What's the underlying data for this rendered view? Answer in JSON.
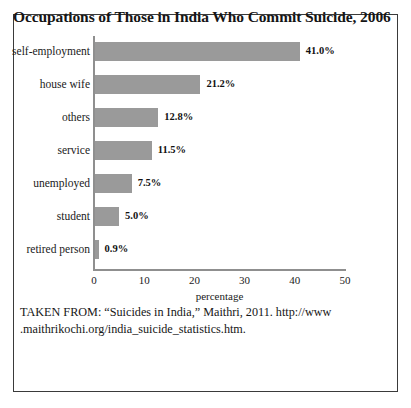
{
  "figure": {
    "title": "Occupations of Those in India Who Commit Suicide, 2006",
    "source_line_1": "TAKEN FROM: “Suicides in India,” Maithri, 2011. http://www",
    "source_line_2": ".maithrikochi.org/india_suicide_statistics.htm.",
    "bar_color": "#9a9a9a",
    "axis_color": "#8f8f8f",
    "border_color": "#3a3a3a"
  },
  "chart_data": {
    "type": "bar",
    "orientation": "horizontal",
    "title": "Occupations of Those in India Who Commit Suicide, 2006",
    "xlabel": "percentage",
    "ylabel": "",
    "xlim": [
      0,
      50
    ],
    "xticks": [
      0,
      10,
      20,
      30,
      40,
      50
    ],
    "grid": false,
    "legend": false,
    "categories": [
      "self-employment",
      "house wife",
      "others",
      "service",
      "unemployed",
      "student",
      "retired person"
    ],
    "values": [
      41.0,
      21.2,
      12.8,
      11.5,
      7.5,
      5.0,
      0.9
    ],
    "data_labels": [
      "41.0%",
      "21.2%",
      "12.8%",
      "11.5%",
      "7.5%",
      "5.0%",
      "0.9%"
    ]
  }
}
